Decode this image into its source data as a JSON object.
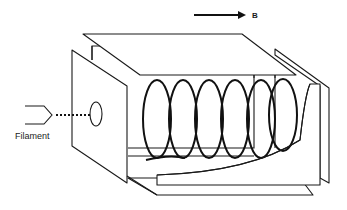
{
  "figure": {
    "type": "schematic",
    "colors": {
      "stroke": "#1a1a1a",
      "background": "#ffffff"
    }
  },
  "labels": {
    "field": "B",
    "filament": "Filament"
  },
  "components": {
    "arrow": {
      "name": "magnetic-field-arrow",
      "direction": "right"
    },
    "coil": {
      "name": "helical-electron-path",
      "turns": 6
    },
    "aperture": {
      "name": "entrance-hole"
    },
    "plates": [
      "top-plate",
      "front-left-plate",
      "right-plate-inner",
      "right-plate-outer",
      "bottom-plate",
      "back-wall",
      "collector-plate"
    ]
  }
}
